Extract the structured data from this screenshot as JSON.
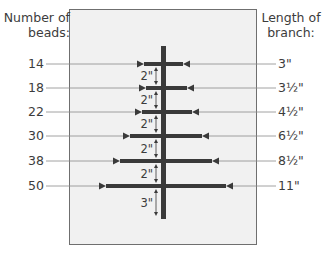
{
  "headers": {
    "left": "Number of beads:",
    "right": "Length of branch:"
  },
  "header_lines": {
    "left": [
      "Number of",
      "beads:"
    ],
    "right": [
      "Length of",
      "branch:"
    ]
  },
  "rows": [
    {
      "beads": "14",
      "length": "3\"",
      "y": 64,
      "x1": 144,
      "x2": 183
    },
    {
      "beads": "18",
      "length": "3½\"",
      "y": 88,
      "x1": 146,
      "x2": 187
    },
    {
      "beads": "22",
      "length": "4½\"",
      "y": 112,
      "x1": 142,
      "x2": 192
    },
    {
      "beads": "30",
      "length": "6½\"",
      "y": 136,
      "x1": 130,
      "x2": 202
    },
    {
      "beads": "38",
      "length": "8½\"",
      "y": 161,
      "x1": 120,
      "x2": 212
    },
    {
      "beads": "50",
      "length": "11\"",
      "y": 186,
      "x1": 106,
      "x2": 226
    }
  ],
  "spacings": [
    {
      "label": "2\"",
      "y1": 64,
      "y2": 88
    },
    {
      "label": "2\"",
      "y1": 88,
      "y2": 112
    },
    {
      "label": "2\"",
      "y1": 112,
      "y2": 136
    },
    {
      "label": "2\"",
      "y1": 136,
      "y2": 161
    },
    {
      "label": "2\"",
      "y1": 161,
      "y2": 186
    },
    {
      "label": "3\"",
      "y1": 186,
      "y2": 219
    }
  ],
  "trunk": {
    "x": 161,
    "width": 5,
    "top": 46,
    "bottom": 219
  },
  "colors": {
    "panel_bg": "#f1f1f1",
    "panel_border": "#6f6f6f",
    "branch": "#3a3a3a",
    "leader": "#8a8a8a",
    "text": "#3c3c3c"
  }
}
